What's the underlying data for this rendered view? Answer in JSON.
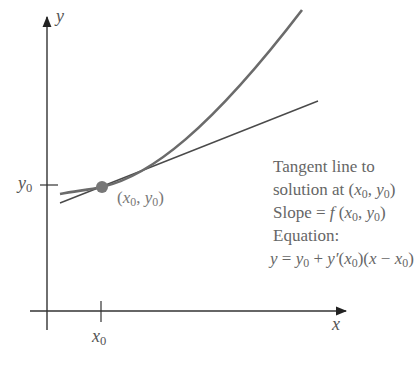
{
  "diagram": {
    "axes": {
      "x_label": "x",
      "y_label": "y",
      "x_tick_label": "x",
      "x_tick_sub": "0",
      "y_tick_label": "y",
      "y_tick_sub": "0"
    },
    "point": {
      "label_x": "x",
      "label_y": "y",
      "sub": "0"
    },
    "annotation": {
      "line1": "Tangent line to",
      "line2_prefix": "solution at ",
      "line3_prefix": "Slope = ",
      "line3_f": "f",
      "line4": "Equation:",
      "eq_y": "y",
      "eq_eq": " = ",
      "eq_plus": " + ",
      "eq_yprime": "y′",
      "eq_x": "x",
      "eq_minus": " − ",
      "sub": "0"
    },
    "colors": {
      "curve": "#6b6b6b",
      "tangent": "#4a4a4a",
      "axis": "#333333",
      "point": "#777777",
      "text": "#666666"
    }
  }
}
